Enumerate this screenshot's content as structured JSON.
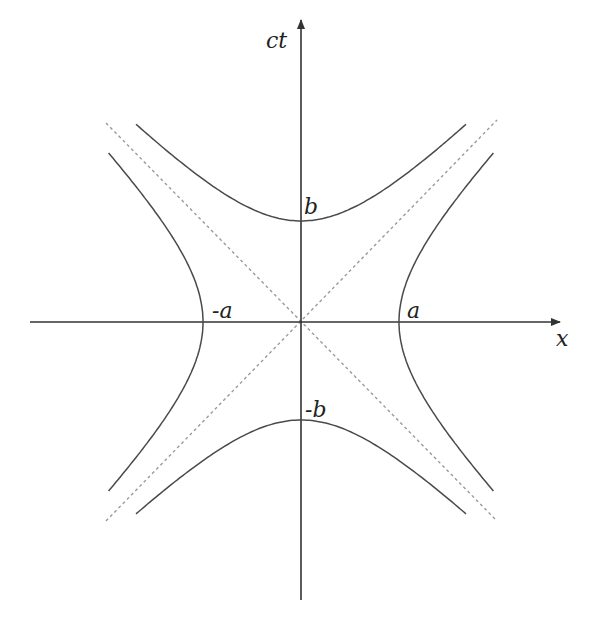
{
  "diagram": {
    "axes": {
      "x_label": "x",
      "y_label": "ct"
    },
    "labels": {
      "a_pos": "a",
      "a_neg": "-a",
      "b_pos": "b",
      "b_neg": "-b"
    },
    "geometry": {
      "origin_px": [
        301,
        322
      ],
      "a_px": 98,
      "b_px": 100,
      "x_axis_range_px": [
        30,
        560
      ],
      "y_axis_range_px": [
        20,
        600
      ]
    },
    "colors": {
      "axis": "#333333",
      "curve": "#4a4a4a",
      "asymptote": "#9a9a9a",
      "label": "#222222"
    },
    "curves": [
      {
        "name": "right-branch",
        "equation": "x^2/a^2 - (ct)^2/b^2 = 1, x>0"
      },
      {
        "name": "left-branch",
        "equation": "x^2/a^2 - (ct)^2/b^2 = 1, x<0"
      },
      {
        "name": "upper-branch",
        "equation": "(ct)^2/b^2 - x^2/a^2 = 1, ct>0"
      },
      {
        "name": "lower-branch",
        "equation": "(ct)^2/b^2 - x^2/a^2 = 1, ct<0"
      }
    ],
    "asymptotes": [
      {
        "name": "asymptote-positive",
        "style": "dashed"
      },
      {
        "name": "asymptote-negative",
        "style": "dashed"
      }
    ]
  }
}
